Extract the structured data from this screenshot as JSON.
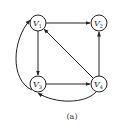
{
  "diagram": {
    "type": "directed-graph",
    "caption": "(a)",
    "nodes": [
      {
        "id": "V1",
        "label": "V",
        "sub": "1"
      },
      {
        "id": "V2",
        "label": "V",
        "sub": "2"
      },
      {
        "id": "V3",
        "label": "V",
        "sub": "3"
      },
      {
        "id": "V4",
        "label": "V",
        "sub": "4"
      }
    ],
    "edges": [
      {
        "from": "V1",
        "to": "V2"
      },
      {
        "from": "V1",
        "to": "V3"
      },
      {
        "from": "V3",
        "to": "V4"
      },
      {
        "from": "V4",
        "to": "V1"
      },
      {
        "from": "V4",
        "to": "V2"
      },
      {
        "from": "V3",
        "to": "V1",
        "curved": true
      },
      {
        "from": "V4",
        "to": "V3",
        "curved": true
      }
    ]
  }
}
